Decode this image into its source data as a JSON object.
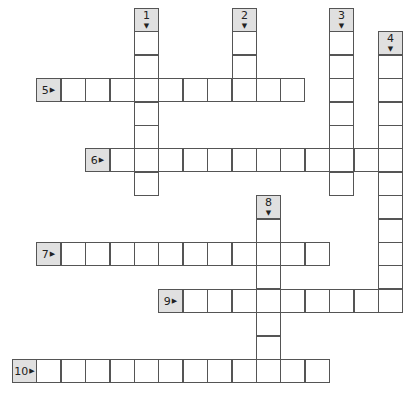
{
  "puzzle": {
    "type": "crossword",
    "grid": {
      "origin_x": 12,
      "origin_y": 8,
      "cell_w": 24.4,
      "cell_h": 23.4
    },
    "colors": {
      "clue_fill": "#e0e0e0",
      "border": "#555555",
      "cell_fill": "#ffffff"
    },
    "entries": [
      {
        "number": "1",
        "direction": "down",
        "clue_col": 5,
        "clue_row": 0,
        "length": 7
      },
      {
        "number": "2",
        "direction": "down",
        "clue_col": 9,
        "clue_row": 0,
        "length": 3
      },
      {
        "number": "3",
        "direction": "down",
        "clue_col": 13,
        "clue_row": 0,
        "length": 7
      },
      {
        "number": "4",
        "direction": "down",
        "clue_col": 15,
        "clue_row": 1,
        "length": 11
      },
      {
        "number": "5",
        "direction": "across",
        "clue_col": 1,
        "clue_row": 3,
        "length": 10
      },
      {
        "number": "6",
        "direction": "across",
        "clue_col": 3,
        "clue_row": 6,
        "length": 12
      },
      {
        "number": "7",
        "direction": "across",
        "clue_col": 1,
        "clue_row": 10,
        "length": 11
      },
      {
        "number": "8",
        "direction": "down",
        "clue_col": 10,
        "clue_row": 8,
        "length": 7
      },
      {
        "number": "9",
        "direction": "across",
        "clue_col": 6,
        "clue_row": 12,
        "length": 9
      },
      {
        "number": "10",
        "direction": "across",
        "clue_col": 0,
        "clue_row": 15,
        "length": 12
      }
    ],
    "icons": {
      "across": "arrow-right-icon",
      "down": "arrow-down-icon"
    }
  }
}
